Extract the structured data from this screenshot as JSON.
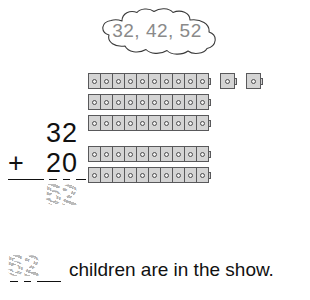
{
  "worksheet": {
    "cloud": {
      "numbers_text": "32, 42, 52",
      "icon": "thought-cloud-icon",
      "text_color": "#8a8a8a"
    },
    "manipulatives": {
      "icon": "linking-cube-icon",
      "cube_fill": "#d4d4d4",
      "cube_stroke": "#59595b",
      "rows": [
        {
          "count": 10,
          "extras": 2
        },
        {
          "count": 10,
          "extras": 0
        },
        {
          "count": 10,
          "extras": 0
        },
        {
          "count": 10,
          "extras": 0
        },
        {
          "count": 10,
          "extras": 0
        }
      ],
      "total": 52
    },
    "addition": {
      "addend_1": "32",
      "operator": "+",
      "addend_2": "20",
      "answer": "52",
      "answer_style": "traced-dotted"
    },
    "answer_statement": {
      "blank_value": "52",
      "blank_style": "traced-dotted",
      "sentence": "children are in the show."
    }
  }
}
